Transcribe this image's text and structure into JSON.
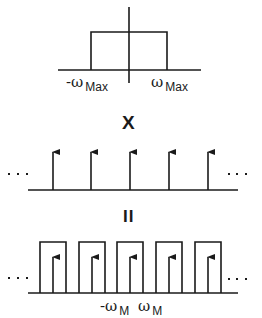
{
  "diagram": {
    "colors": {
      "stroke": "#1a1a1a",
      "background": "#ffffff"
    },
    "top_panel": {
      "name": "baseband-spectrum",
      "labels": {
        "neg": "-ω",
        "neg_sub": "Max",
        "pos": "ω",
        "pos_sub": "Max"
      }
    },
    "operator_multiply": "X",
    "middle_panel": {
      "name": "impulse-train",
      "impulse_count": 5,
      "ellipsis_left": "· · ·",
      "ellipsis_right": "· · ·"
    },
    "operator_equals": "II",
    "bottom_panel": {
      "name": "sampled-spectrum",
      "replica_count": 5,
      "ellipsis_left": "· · ·",
      "ellipsis_right": "· · ·",
      "labels": {
        "neg": "-ω",
        "neg_sub": "M",
        "pos": "ω",
        "pos_sub": "M"
      }
    }
  }
}
